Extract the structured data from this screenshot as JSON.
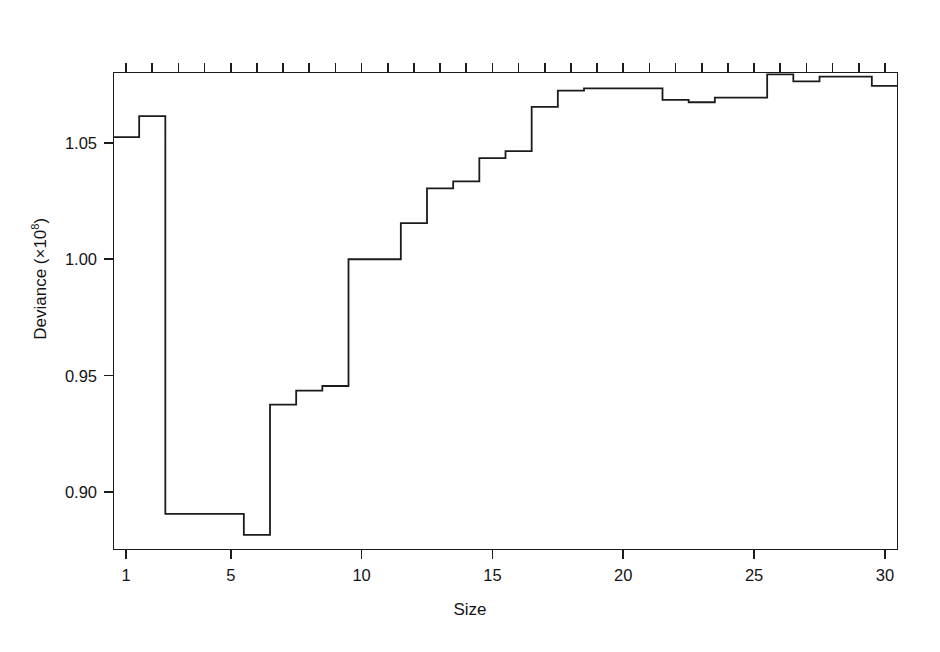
{
  "chart_data": {
    "type": "line",
    "subtype": "step",
    "title": "",
    "xlabel": "Size",
    "ylabel": "Deviance (×10⁸)",
    "ylabel_text": "Deviance (×10",
    "ylabel_exponent": "8",
    "ylabel_suffix": ")",
    "grid": false,
    "legend": null,
    "line_color": "#1b1b1b",
    "background_color": "#ffffff",
    "xlim": [
      0.5,
      30.5
    ],
    "ylim": [
      0.875,
      1.0805
    ],
    "xticks": [
      1,
      5,
      10,
      15,
      20,
      25,
      30
    ],
    "xtick_labels": [
      "1",
      "5",
      "10",
      "15",
      "20",
      "25",
      "30"
    ],
    "yticks": [
      1.05,
      1.0,
      0.95,
      0.9
    ],
    "ytick_labels": [
      "1.05",
      "1.00",
      "0.95",
      "0.90"
    ],
    "secondary_xaxis": {
      "position": "top",
      "label": "",
      "tick_positions": [
        1,
        2,
        3,
        4,
        5,
        6,
        7,
        8,
        9,
        10,
        11,
        12,
        13,
        14,
        15,
        16,
        17,
        18,
        19,
        20,
        21,
        22,
        23,
        24,
        25,
        26,
        27,
        28,
        29,
        30
      ],
      "labeled_ticks": [
        2,
        5,
        8,
        11,
        14,
        18,
        22,
        26
      ],
      "labels": [
        "8400000",
        "2900000",
        "1300000",
        "990000",
        "730000",
        "700000",
        "290000",
        "1200"
      ]
    },
    "x": [
      1,
      2,
      3,
      4,
      5,
      6,
      7,
      8,
      9,
      10,
      11,
      12,
      13,
      14,
      15,
      16,
      17,
      18,
      19,
      20,
      21,
      22,
      23,
      24,
      25,
      26,
      27,
      28,
      29,
      30
    ],
    "values": [
      1.0525,
      1.0615,
      0.8905,
      0.8905,
      0.8905,
      0.8815,
      0.9375,
      0.9435,
      0.9455,
      1.0,
      1.0,
      1.0155,
      1.0305,
      1.0335,
      1.0435,
      1.0465,
      1.0655,
      1.0725,
      1.0735,
      1.0735,
      1.0735,
      1.0685,
      1.0675,
      1.0695,
      1.0695,
      1.0795,
      1.0765,
      1.0785,
      1.0785,
      1.0745
    ],
    "series": [
      {
        "name": "Deviance",
        "values": [
          1.0525,
          1.0615,
          0.8905,
          0.8905,
          0.8905,
          0.8815,
          0.9375,
          0.9435,
          0.9455,
          1.0,
          1.0,
          1.0155,
          1.0305,
          1.0335,
          1.0435,
          1.0465,
          1.0655,
          1.0725,
          1.0735,
          1.0735,
          1.0735,
          1.0685,
          1.0675,
          1.0695,
          1.0695,
          1.0795,
          1.0765,
          1.0785,
          1.0785,
          1.0745
        ]
      }
    ]
  }
}
